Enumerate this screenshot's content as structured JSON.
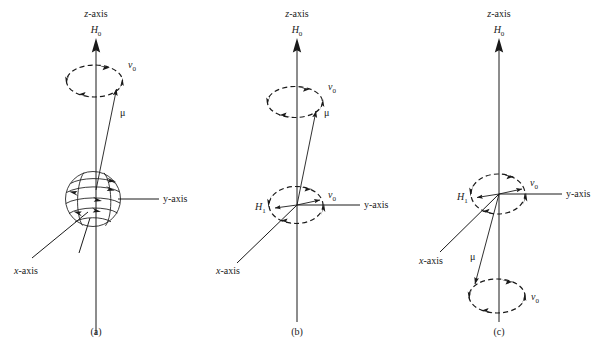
{
  "figure": {
    "background_color": "#ffffff",
    "ink_color": "#1a1a1a",
    "width": 609,
    "height": 356
  },
  "labels": {
    "z_axis": "z-axis",
    "y_axis": "y-axis",
    "x_axis": "x-axis",
    "h0": "H",
    "h0_sub": "0",
    "h1": "H",
    "h1_sub": "1",
    "nu": "v",
    "nu_sub": "0",
    "mu": "μ"
  },
  "panels": [
    {
      "id": "a",
      "caption": "(a)",
      "axis_center_x": 96,
      "labels": {
        "z_axis": "z-axis",
        "h0": "H",
        "h0_sub": "0",
        "y_axis": "y-axis",
        "x_axis": "x-axis",
        "mu": "μ",
        "nu": "v",
        "nu_sub": "0"
      },
      "features": [
        "spinning sphere at origin with four latitude arrows",
        "upper dashed precession ellipse with two arrowheads",
        "magnetic moment vector mu tilted from z-axis",
        "H0 field along z-axis"
      ],
      "ellipse_count": 1,
      "has_sphere": true
    },
    {
      "id": "b",
      "caption": "(b)",
      "axis_center_x": 297,
      "labels": {
        "z_axis": "z-axis",
        "h0": "H",
        "h0_sub": "0",
        "y_axis": "y-axis",
        "x_axis": "x-axis",
        "mu": "μ",
        "nu_upper": "v",
        "nu_upper_sub": "0",
        "h1": "H",
        "h1_sub": "1",
        "nu_lower": "v",
        "nu_lower_sub": "0"
      },
      "features": [
        "upper dashed precession ellipse with nu-0 label",
        "mu vector tilted from origin toward upper ellipse",
        "lower dashed ellipse at origin in xy-plane",
        "H1 rotating field arrow pointing left from origin",
        "nu-0 arrow pointing right from origin"
      ],
      "ellipse_count": 2,
      "has_sphere": false
    },
    {
      "id": "c",
      "caption": "(c)",
      "axis_center_x": 499,
      "labels": {
        "z_axis": "z-axis",
        "h0": "H",
        "h0_sub": "0",
        "y_axis": "y-axis",
        "x_axis": "x-axis",
        "mu": "μ",
        "h1": "H",
        "h1_sub": "1",
        "nu_upper": "v",
        "nu_upper_sub": "0",
        "nu_lower": "v",
        "nu_lower_sub": "0"
      },
      "features": [
        "dashed ellipse at origin in xy-plane with H1 and nu-0",
        "mu vector inverted pointing downward",
        "lower dashed precession ellipse below origin with nu-0",
        "H0 field along z-axis"
      ],
      "ellipse_count": 2,
      "has_sphere": false
    }
  ]
}
